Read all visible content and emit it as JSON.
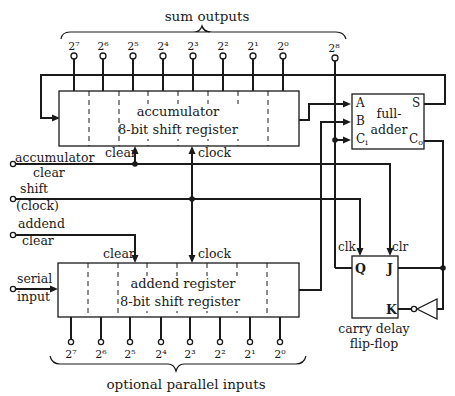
{
  "top_bracket_label": "sum outputs",
  "bottom_bracket_label": "optional parallel inputs",
  "sum_outputs": [
    "2⁷",
    "2⁶",
    "2⁵",
    "2⁴",
    "2³",
    "2²",
    "2¹",
    "2⁰"
  ],
  "carry_output": "2⁸",
  "parallel_inputs": [
    "2⁷",
    "2⁶",
    "2⁵",
    "2⁴",
    "2³",
    "2²",
    "2¹",
    "2⁰"
  ],
  "accumulator": {
    "line1": "accumulator",
    "line2": "8-bit shift register",
    "clear_label": "clear",
    "clock_label": "clock"
  },
  "addend": {
    "line1": "addend register",
    "line2": "8-bit shift register",
    "clear_label": "clear",
    "clock_label": "clock"
  },
  "full_adder": {
    "line1": "full-",
    "line2": "adder",
    "pin_a": "A",
    "pin_b": "B",
    "pin_ci": "C",
    "pin_ci_sub": "i",
    "pin_s": "S",
    "pin_co": "C",
    "pin_co_sub": "o"
  },
  "flip_flop": {
    "line1": "carry delay",
    "line2": "flip-flop",
    "pin_q": "Q",
    "pin_j": "J",
    "pin_k": "K",
    "clk_label": "clk",
    "clr_label": "clr"
  },
  "inputs": {
    "acc_clear_1": "accumulator",
    "acc_clear_2": "clear",
    "shift_1": "shift",
    "shift_2": "(clock)",
    "addend_clear_1": "addend",
    "addend_clear_2": "clear",
    "serial_1": "serial",
    "serial_2": "input"
  }
}
